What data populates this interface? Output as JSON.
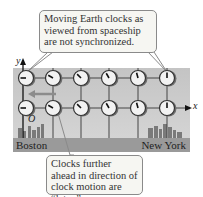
{
  "callouts": {
    "top": "Moving Earth clocks as viewed from spaceship are not synchronized.",
    "bottom": "Clocks further ahead in direction of clock motion are “later.”"
  },
  "axes": {
    "y_label": "y",
    "x_label": "x",
    "origin_label": "O"
  },
  "cities": {
    "left": "Boston",
    "right": "New York"
  },
  "motion_arrow": {
    "direction": "left",
    "color": "#8c8c8c"
  },
  "clocks": {
    "columns_x": [
      26,
      53,
      81,
      109,
      138,
      167
    ],
    "rows_y": [
      78,
      108
    ],
    "hand_angles_deg": [
      270,
      300,
      315,
      330,
      345,
      0
    ]
  },
  "colors": {
    "panel": "#c8c8c8",
    "ground": "#9a9a9a",
    "callout_bg": "#f6f6f2",
    "clock_face": "#f2f2f2"
  }
}
